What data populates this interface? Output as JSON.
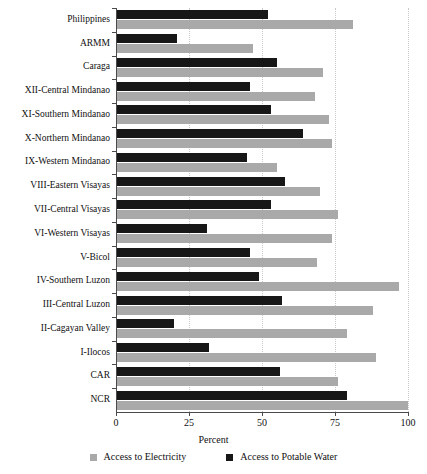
{
  "chart_data": {
    "type": "bar",
    "orientation": "horizontal",
    "title": "",
    "xlabel": "Percent",
    "ylabel": "",
    "xlim": [
      0,
      100
    ],
    "xticks": [
      0,
      25,
      50,
      75,
      100
    ],
    "grid": "vertical-dotted",
    "legend_position": "bottom",
    "categories": [
      "Philippines",
      "ARMM",
      "Caraga",
      "XII-Central Mindanao",
      "XI-Southern Mindanao",
      "X-Northern Mindanao",
      "IX-Western Mindanao",
      "VIII-Eastern Visayas",
      "VII-Central Visayas",
      "VI-Western Visayas",
      "V-Bicol",
      "IV-Southern Luzon",
      "III-Central Luzon",
      "II-Cagayan Valley",
      "I-Ilocos",
      "CAR",
      "NCR"
    ],
    "series": [
      {
        "name": "Access to Electricity",
        "color": "#a9a9a9",
        "values": [
          81,
          47,
          71,
          68,
          73,
          74,
          55,
          70,
          76,
          74,
          69,
          97,
          88,
          79,
          89,
          76,
          100
        ]
      },
      {
        "name": "Access to Potable Water",
        "color": "#171717",
        "values": [
          52,
          21,
          55,
          46,
          53,
          64,
          45,
          58,
          53,
          31,
          46,
          49,
          57,
          20,
          32,
          56,
          79
        ]
      }
    ]
  },
  "axis": {
    "x_tick_labels": [
      "0",
      "25",
      "50",
      "75",
      "100"
    ],
    "x_axis_title": "Percent"
  },
  "legend": {
    "items": [
      {
        "label": "Access to Electricity",
        "color": "#a9a9a9"
      },
      {
        "label": "Access to Potable Water",
        "color": "#171717"
      }
    ]
  }
}
